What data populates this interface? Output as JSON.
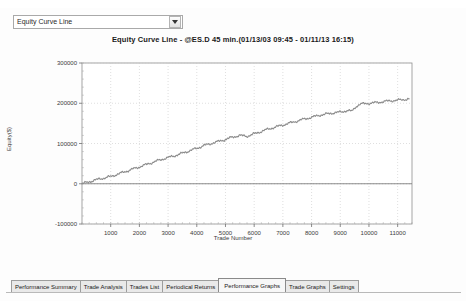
{
  "window": {
    "graph_selector": {
      "value": "Equity Curve Line",
      "dropdown_icon": "chevron-down-icon"
    }
  },
  "chart_data": {
    "type": "line",
    "title": "Equity Curve Line - @ES.D 45 min.(01/13/03 09:45 - 01/11/13 16:15)",
    "xlabel": "Trade Number",
    "ylabel": "Equity($)",
    "xlim": [
      0,
      11500
    ],
    "ylim": [
      -100000,
      300000
    ],
    "xticks": [
      1000,
      2000,
      3000,
      4000,
      5000,
      6000,
      7000,
      8000,
      9000,
      10000,
      11000
    ],
    "xticklabels": [
      "1000",
      "2000",
      "3000",
      "4000",
      "5000",
      "6000",
      "7000",
      "8000",
      "9000",
      "10000",
      "11000"
    ],
    "yticks": [
      -100000,
      0,
      100000,
      200000,
      300000
    ],
    "yticklabels": [
      "-100000",
      "0",
      "100000",
      "200000",
      "300000"
    ],
    "grid": true,
    "legend": "none",
    "series": [
      {
        "name": "Equity Curve Line",
        "color": "#8c8c8c",
        "x": [
          0,
          250,
          500,
          750,
          1000,
          1250,
          1500,
          1750,
          2000,
          2250,
          2500,
          2750,
          3000,
          3250,
          3500,
          3750,
          4000,
          4250,
          4500,
          4750,
          5000,
          5250,
          5500,
          5750,
          6000,
          6250,
          6500,
          6750,
          7000,
          7250,
          7500,
          7750,
          8000,
          8250,
          8500,
          8750,
          9000,
          9250,
          9400,
          9550,
          9700,
          10000,
          10300,
          10600,
          10900,
          11200,
          11400
        ],
        "y": [
          0,
          5000,
          10000,
          14000,
          18000,
          24000,
          30000,
          36000,
          42000,
          48000,
          54000,
          60000,
          65000,
          70000,
          76000,
          82000,
          88000,
          95000,
          100000,
          105000,
          110000,
          116000,
          120000,
          118000,
          124000,
          130000,
          136000,
          141000,
          146000,
          151000,
          156000,
          161000,
          165000,
          170000,
          173000,
          176000,
          178000,
          182000,
          180000,
          192000,
          198000,
          200000,
          202000,
          205000,
          207000,
          209000,
          211000
        ]
      }
    ]
  },
  "tabs": [
    {
      "label": "Performance Summary",
      "active": false
    },
    {
      "label": "Trade Analysis",
      "active": false
    },
    {
      "label": "Trades List",
      "active": false
    },
    {
      "label": "Periodical Returns",
      "active": false
    },
    {
      "label": "Performance Graphs",
      "active": true
    },
    {
      "label": "Trade Graphs",
      "active": false
    },
    {
      "label": "Settings",
      "active": false
    }
  ]
}
